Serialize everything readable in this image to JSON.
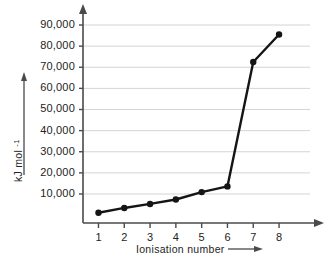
{
  "chart_data": {
    "type": "line",
    "title": "",
    "subtitle": "",
    "xlabel": "Ionisation number",
    "ylabel": "kJ mol",
    "ylabel_superscript": "-1",
    "x": [
      1,
      2,
      3,
      4,
      5,
      6,
      7,
      8
    ],
    "values": [
      1100,
      3400,
      5300,
      7400,
      10900,
      13600,
      72500,
      85500
    ],
    "xtick_labels": [
      "1",
      "2",
      "3",
      "4",
      "5",
      "6",
      "7",
      "8"
    ],
    "ytick_labels": [
      "10,000",
      "20,000",
      "30,000",
      "40,000",
      "50,000",
      "60,000",
      "70,000",
      "80,000",
      "90,000"
    ],
    "ytick_values": [
      10000,
      20000,
      30000,
      40000,
      50000,
      60000,
      70000,
      80000,
      90000
    ],
    "xlim": [
      0.4,
      9.2
    ],
    "ylim": [
      0,
      95000
    ],
    "grid": true,
    "legend": null,
    "legend_position": "none",
    "marker": "circle",
    "series_color": "#151515",
    "grid_color": "#c9c9c9",
    "axis_color": "#4a4a4a",
    "background_color": "#ffffff",
    "x_axis_arrow": true,
    "y_axis_arrow": true,
    "xlabel_arrow": true,
    "ylabel_arrow": true
  }
}
